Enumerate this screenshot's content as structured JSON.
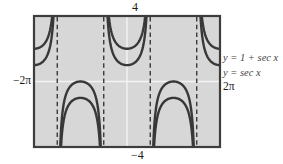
{
  "figure": {
    "top_label": "4",
    "bottom_label": "−4",
    "left_label": "−2π",
    "right_label": "2π",
    "legend": [
      "y = 1 + sec x",
      "y = sec x"
    ]
  },
  "colors": {
    "plot_background": "#d7d7d7",
    "plot_border": "#3d3d3d",
    "curve": "#383838",
    "asymptote_dash": "#2e2e2e",
    "screen_axes": "#f4f4f4",
    "label_text": "#1c1c1c",
    "legend_text": "#454545",
    "page_background": "#ffffff"
  },
  "chart_data": {
    "type": "line",
    "title": "",
    "xlabel": "",
    "ylabel": "",
    "xlim": [
      -6.2832,
      6.2832
    ],
    "ylim": [
      -4,
      4
    ],
    "x_edge_labels": [
      "−2π",
      "2π"
    ],
    "y_edge_labels": [
      "4",
      "−4"
    ],
    "grid": false,
    "legend_position": "right-outside",
    "series": [
      {
        "name": "y = 1 + sec x",
        "base": "sec",
        "offset": 1
      },
      {
        "name": "y = sec x",
        "base": "sec",
        "offset": 0
      }
    ],
    "asymptotes_x": [
      -4.7124,
      -1.5708,
      1.5708,
      4.7124
    ],
    "axes_cross": {
      "x": 0,
      "y": 0
    },
    "key_points": {
      "sec_local_min": [
        [
          -6.2832,
          1
        ],
        [
          0,
          1
        ],
        [
          6.2832,
          1
        ]
      ],
      "sec_local_max": [
        [
          -3.1416,
          -1
        ],
        [
          3.1416,
          -1
        ]
      ],
      "one_plus_sec_local_min": [
        [
          -6.2832,
          2
        ],
        [
          0,
          2
        ],
        [
          6.2832,
          2
        ]
      ],
      "one_plus_sec_local_max": [
        [
          -3.1416,
          0
        ],
        [
          3.1416,
          0
        ]
      ]
    }
  }
}
